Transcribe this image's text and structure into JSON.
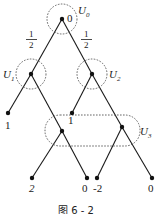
{
  "diagram": {
    "caption": "图 6 - 2",
    "nodes": [
      {
        "id": "root",
        "label": "0",
        "infoset": "U0"
      },
      {
        "id": "n1",
        "infoset": "U1"
      },
      {
        "id": "n2",
        "infoset": "U2"
      },
      {
        "id": "n3",
        "infoset": "U3"
      },
      {
        "id": "n4",
        "infoset": "U3"
      },
      {
        "id": "l1",
        "payoff": "1"
      },
      {
        "id": "l2",
        "payoff": "1"
      },
      {
        "id": "l3",
        "payoff": "2"
      },
      {
        "id": "l4",
        "payoff": "0"
      },
      {
        "id": "l5",
        "payoff": "-2"
      },
      {
        "id": "l6",
        "payoff": "0"
      }
    ],
    "edges": [
      {
        "from": "root",
        "to": "n1",
        "prob": {
          "num": "1",
          "den": "2"
        }
      },
      {
        "from": "root",
        "to": "n2",
        "prob": {
          "num": "1",
          "den": "2"
        }
      },
      {
        "from": "n1",
        "to": "l1"
      },
      {
        "from": "n1",
        "to": "n3"
      },
      {
        "from": "n2",
        "to": "l2"
      },
      {
        "from": "n2",
        "to": "n4"
      },
      {
        "from": "n3",
        "to": "l3"
      },
      {
        "from": "n3",
        "to": "l4"
      },
      {
        "from": "n4",
        "to": "l5"
      },
      {
        "from": "n4",
        "to": "l6"
      }
    ],
    "infosets": {
      "U0": {
        "main": "U",
        "sub": "0"
      },
      "U1": {
        "main": "U",
        "sub": "1"
      },
      "U2": {
        "main": "U",
        "sub": "2"
      },
      "U3": {
        "main": "U",
        "sub": "3"
      }
    }
  }
}
